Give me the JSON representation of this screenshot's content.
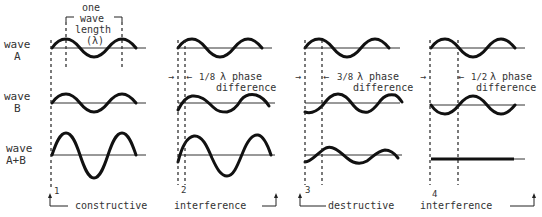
{
  "row_labels": {
    "wave_a": [
      "wave",
      "A"
    ],
    "wave_b": [
      "wave",
      "B"
    ],
    "wave_sum": [
      "wave",
      "A+B"
    ]
  },
  "wavelength_label": [
    "one",
    "wave",
    "length",
    "(λ)"
  ],
  "panels": [
    {
      "number": "1",
      "phase_fraction": null,
      "phase_text": null,
      "diff_text": null
    },
    {
      "number": "2",
      "phase_fraction": "1/8",
      "phase_text": "λ phase",
      "diff_text": "difference"
    },
    {
      "number": "3",
      "phase_fraction": "3/8",
      "phase_text": "λ phase",
      "diff_text": "difference"
    },
    {
      "number": "4",
      "phase_fraction": "1/2",
      "phase_text": "λ phase",
      "diff_text": "difference"
    }
  ],
  "groups": {
    "constructive_a": "constructive",
    "constructive_b": "interference",
    "destructive_a": "destructive",
    "destructive_b": "interference"
  },
  "colors": {
    "ink": "#111111",
    "background": "#ffffff"
  }
}
